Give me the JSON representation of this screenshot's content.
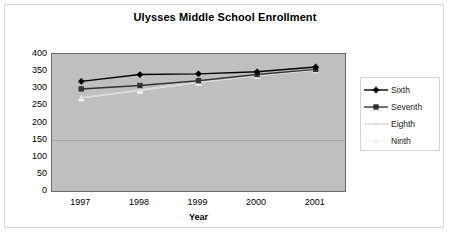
{
  "chart_data": {
    "type": "line",
    "title": "Ulysses Middle School Enrollment",
    "xlabel": "Year",
    "ylabel": "",
    "categories": [
      "1997",
      "1998",
      "1999",
      "2000",
      "2001"
    ],
    "x": [
      1997,
      1998,
      1999,
      2000,
      2001
    ],
    "ylim": [
      0,
      400
    ],
    "yticks": [
      "400",
      "350",
      "300",
      "250",
      "200",
      "150",
      "100",
      "50",
      "0"
    ],
    "ytick_values": [
      400,
      350,
      300,
      250,
      200,
      150,
      100,
      50,
      0
    ],
    "grid": true,
    "legend_position": "right",
    "plot_background": "#bfbfbf",
    "series": [
      {
        "name": "Sixth",
        "values": [
          320,
          340,
          342,
          348,
          362
        ],
        "color": "#000000",
        "marker": "diamond"
      },
      {
        "name": "Seventh",
        "values": [
          298,
          308,
          322,
          340,
          355
        ],
        "color": "#333333",
        "marker": "square"
      },
      {
        "name": "Eighth",
        "values": [
          272,
          295,
          318,
          338,
          355
        ],
        "color": "#d8d8d8",
        "marker": "dot"
      },
      {
        "name": "Ninth",
        "values": [
          272,
          294,
          317,
          337,
          354
        ],
        "color": "#f2f2f2",
        "marker": "triangle"
      }
    ]
  },
  "legend": {
    "items": [
      {
        "label": "Sixth"
      },
      {
        "label": "Seventh"
      },
      {
        "label": "Eighth"
      },
      {
        "label": "Ninth"
      }
    ]
  }
}
